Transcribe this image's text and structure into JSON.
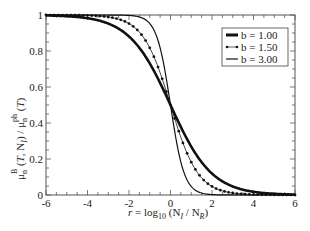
{
  "chart_data": {
    "type": "line",
    "title": "",
    "xlabel": "r = log10 (N_I / N_R)",
    "ylabel": "μ_n^B (T, N_I) / μ_n^ph (T)",
    "xlim": [
      -6,
      6
    ],
    "ylim": [
      0,
      1
    ],
    "x_ticks": [
      "-6",
      "-4",
      "-2",
      "0",
      "2",
      "4",
      "6"
    ],
    "y_ticks": [
      "0",
      "0.2",
      "0.4",
      "0.6",
      "0.8",
      "1"
    ],
    "grid": false,
    "legend_position": "upper right",
    "x": [
      -6,
      -5,
      -4,
      -3,
      -2.5,
      -2,
      -1.5,
      -1,
      -0.5,
      0,
      0.5,
      1,
      1.5,
      2,
      2.5,
      3,
      4,
      5,
      6
    ],
    "series": [
      {
        "name": "b = 1.00",
        "style": "thick solid",
        "values": [
          0.998,
          0.993,
          0.982,
          0.953,
          0.924,
          0.881,
          0.818,
          0.731,
          0.622,
          0.5,
          0.378,
          0.269,
          0.182,
          0.119,
          0.076,
          0.047,
          0.018,
          0.007,
          0.002
        ]
      },
      {
        "name": "b = 1.50",
        "style": "dotted with markers",
        "values": [
          1.0,
          0.999,
          0.998,
          0.989,
          0.977,
          0.953,
          0.905,
          0.818,
          0.679,
          0.5,
          0.321,
          0.182,
          0.095,
          0.047,
          0.023,
          0.011,
          0.002,
          0.001,
          0.0
        ]
      },
      {
        "name": "b = 3.00",
        "style": "thin solid",
        "values": [
          1.0,
          1.0,
          1.0,
          1.0,
          0.999,
          0.998,
          0.989,
          0.953,
          0.818,
          0.5,
          0.182,
          0.047,
          0.011,
          0.002,
          0.001,
          0.0,
          0.0,
          0.0,
          0.0
        ]
      }
    ]
  },
  "legend": {
    "items": [
      {
        "label": "b = 1.00"
      },
      {
        "label": "b = 1.50"
      },
      {
        "label": "b = 3.00"
      }
    ]
  },
  "axes": {
    "x_label": {
      "prefix": "r = log",
      "sub10": "10",
      "mid": "(N",
      "subI": "I",
      "mid2": " / N",
      "subR": "R",
      "end": ")"
    },
    "y_label": {
      "mu1": "μ",
      "sub_n": "n",
      "sup_B": "B",
      "args": "(T, N",
      "subI": "I",
      "mid": ") / μ",
      "sub_n2": "n",
      "sup_ph": "ph",
      "end": "(T)"
    }
  }
}
